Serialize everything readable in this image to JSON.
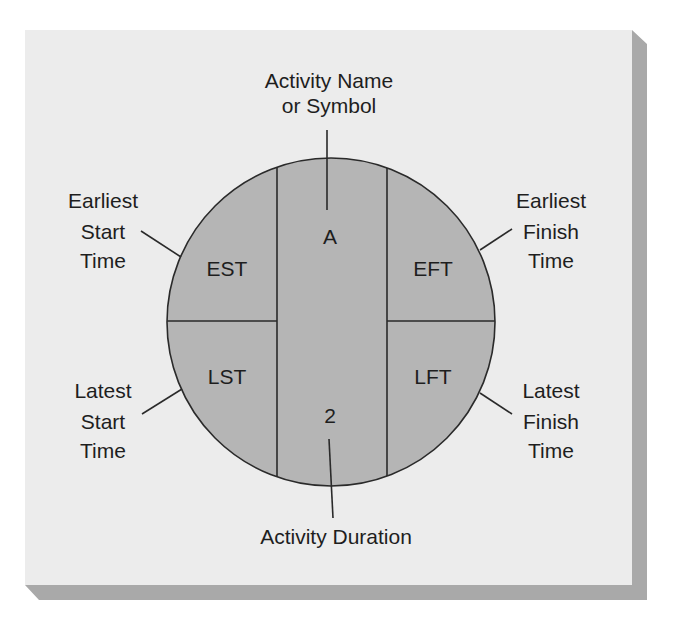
{
  "diagram": {
    "colors": {
      "page_background": "#ffffff",
      "panel": "#ececec",
      "panel_shadow": "#a9a9a9",
      "circle_fill": "#b5b5b5",
      "line": "#2a2a2a",
      "text": "#1e1e1e"
    },
    "node": {
      "activity_symbol": "A",
      "duration": "2",
      "cells": {
        "top_left": "EST",
        "top_right": "EFT",
        "bottom_left": "LST",
        "bottom_right": "LFT"
      }
    },
    "callouts": {
      "top": {
        "line1": "Activity Name",
        "line2": "or Symbol"
      },
      "bottom": {
        "line1": "Activity Duration"
      },
      "upper_left": {
        "line1": "Earliest",
        "line2": "Start",
        "line3": "Time"
      },
      "lower_left": {
        "line1": "Latest",
        "line2": "Start",
        "line3": "Time"
      },
      "upper_right": {
        "line1": "Earliest",
        "line2": "Finish",
        "line3": "Time"
      },
      "lower_right": {
        "line1": "Latest",
        "line2": "Finish",
        "line3": "Time"
      }
    }
  }
}
